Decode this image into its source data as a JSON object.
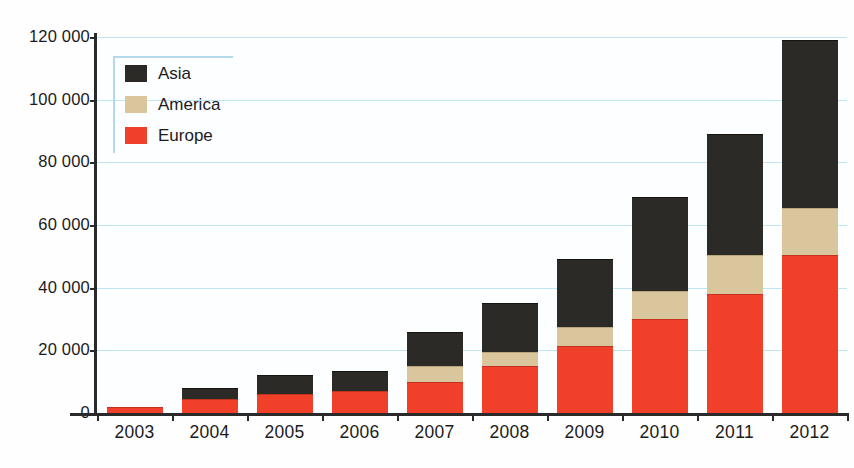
{
  "chart_data": {
    "type": "bar",
    "stacked": true,
    "title": "",
    "xlabel": "",
    "ylabel": "",
    "categories": [
      "2003",
      "2004",
      "2005",
      "2006",
      "2007",
      "2008",
      "2009",
      "2010",
      "2011",
      "2012"
    ],
    "series": [
      {
        "name": "Europe",
        "color": "#f0402a",
        "values": [
          2000,
          4500,
          6000,
          7000,
          10000,
          15000,
          21500,
          30000,
          38000,
          50500
        ]
      },
      {
        "name": "America",
        "color": "#dac69c",
        "values": [
          0,
          0,
          0,
          0,
          5000,
          4500,
          6000,
          9000,
          12500,
          15000
        ]
      },
      {
        "name": "Asia",
        "color": "#2b2a26",
        "values": [
          0,
          3500,
          6000,
          6500,
          11000,
          15500,
          21500,
          30000,
          38500,
          53500
        ]
      }
    ],
    "totals": [
      2000,
      8000,
      12000,
      13500,
      26000,
      35000,
      49000,
      69000,
      89000,
      119000
    ],
    "ylim": [
      0,
      120000
    ],
    "ytick_values": [
      0,
      20000,
      40000,
      60000,
      80000,
      100000,
      120000
    ],
    "ytick_labels": [
      "0",
      "20 000",
      "40 000",
      "60 000",
      "80 000",
      "100 000",
      "120 000"
    ],
    "grid": true,
    "grid_color": "#bfe4f2",
    "legend_position": "top-left",
    "legend_order": [
      "Asia",
      "America",
      "Europe"
    ],
    "axis_color": "#2a2a2a",
    "background": "#fcfeff"
  },
  "legend": {
    "entries": [
      {
        "label": "Asia",
        "key": "asia"
      },
      {
        "label": "America",
        "key": "america"
      },
      {
        "label": "Europe",
        "key": "europe"
      }
    ]
  }
}
